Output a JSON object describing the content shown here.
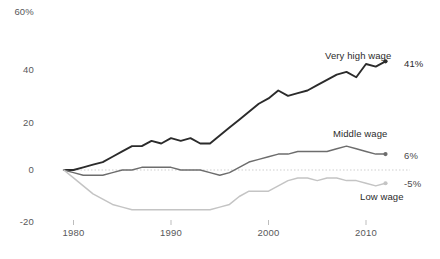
{
  "chart_data": {
    "type": "line",
    "title": "",
    "subtitle": "",
    "xlabel": "",
    "ylabel": "",
    "xlim": [
      1979,
      2013
    ],
    "ylim": [
      -20,
      60
    ],
    "grid": false,
    "zero_line": true,
    "legend_position": "inline-end-of-line",
    "x_tick_labels": [
      "1980",
      "1990",
      "2000",
      "2010"
    ],
    "x_ticks": [
      1980,
      1990,
      2000,
      2010
    ],
    "y_tick_labels": [
      "60%",
      "40",
      "20",
      "0",
      "-20"
    ],
    "y_ticks": [
      60,
      40,
      20,
      0,
      -20
    ],
    "x": [
      1979,
      1980,
      1981,
      1982,
      1983,
      1984,
      1985,
      1986,
      1987,
      1988,
      1989,
      1990,
      1991,
      1992,
      1993,
      1994,
      1995,
      1996,
      1997,
      1998,
      1999,
      2000,
      2001,
      2002,
      2003,
      2004,
      2005,
      2006,
      2007,
      2008,
      2009,
      2010,
      2011,
      2012
    ],
    "series": [
      {
        "name": "Very high wage",
        "color": "#2b2b2b",
        "end_label": "41%",
        "end_value": 41,
        "values": [
          0,
          0,
          1,
          2,
          3,
          5,
          7,
          9,
          9,
          11,
          10,
          12,
          11,
          12,
          10,
          10,
          13,
          16,
          19,
          22,
          25,
          27,
          30,
          28,
          29,
          30,
          32,
          34,
          36,
          37,
          35,
          40,
          39,
          41
        ]
      },
      {
        "name": "Middle wage",
        "color": "#6d6d6d",
        "end_label": "6%",
        "end_value": 6,
        "values": [
          0,
          -1,
          -2,
          -2,
          -2,
          -1,
          0,
          0,
          1,
          1,
          1,
          1,
          0,
          0,
          0,
          -1,
          -2,
          -1,
          1,
          3,
          4,
          5,
          6,
          6,
          7,
          7,
          7,
          7,
          8,
          9,
          8,
          7,
          6,
          6
        ]
      },
      {
        "name": "Low wage",
        "color": "#c4c4c4",
        "end_label": "-5%",
        "end_value": -5,
        "values": [
          0,
          -3,
          -6,
          -9,
          -11,
          -13,
          -14,
          -15,
          -15,
          -15,
          -15,
          -15,
          -15,
          -15,
          -15,
          -15,
          -14,
          -13,
          -10,
          -8,
          -8,
          -8,
          -6,
          -4,
          -3,
          -3,
          -4,
          -3,
          -3,
          -4,
          -4,
          -5,
          -6,
          -5
        ]
      }
    ]
  },
  "labels": {
    "very_high_wage": "Very high wage",
    "middle_wage": "Middle wage",
    "low_wage": "Low wage"
  }
}
